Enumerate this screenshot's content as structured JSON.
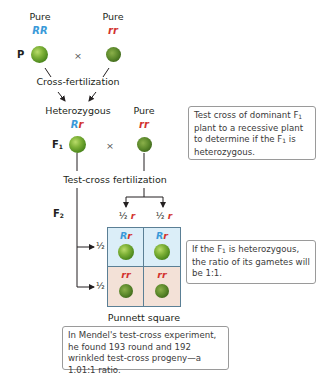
{
  "colors": {
    "dominant_allele": "#3a9ad9",
    "recessive_allele": "#d2322d",
    "punnett_top_fill": "#dbeef8",
    "punnett_bottom_fill": "#f3e1d7",
    "punnett_border": "#5a7f95",
    "note_border": "#9a9a9a"
  },
  "parental": {
    "generation_label": "P",
    "left": {
      "purity": "Pure",
      "genotype": {
        "dominant": "RR",
        "recessive": ""
      },
      "phenotype": "round"
    },
    "cross_symbol": "×",
    "right": {
      "purity": "Pure",
      "genotype": {
        "dominant": "",
        "recessive": "rr"
      },
      "phenotype": "wrinkled"
    },
    "process": "Cross-fertilization"
  },
  "f1": {
    "generation_label": "F",
    "generation_sub": "1",
    "left": {
      "purity": "Heterozygous",
      "genotype": {
        "dominant": "R",
        "recessive": "r"
      },
      "phenotype": "round"
    },
    "cross_symbol": "×",
    "right": {
      "purity": "Pure",
      "genotype": {
        "dominant": "",
        "recessive": "rr"
      },
      "phenotype": "wrinkled"
    },
    "process": "Test-cross fertilization"
  },
  "f2": {
    "generation_label": "F",
    "generation_sub": "2",
    "column_gametes": [
      {
        "fraction": "½",
        "allele": "r"
      },
      {
        "fraction": "½",
        "allele": "r"
      }
    ],
    "row_gametes": [
      {
        "fraction": "½",
        "allele": "R",
        "kind": "dominant"
      },
      {
        "fraction": "½",
        "allele": "r",
        "kind": "recessive"
      }
    ],
    "cells": [
      [
        {
          "dominant": "R",
          "recessive": "r",
          "phenotype": "round"
        },
        {
          "dominant": "R",
          "recessive": "r",
          "phenotype": "round"
        }
      ],
      [
        {
          "dominant": "",
          "recessive": "rr",
          "phenotype": "wrinkled"
        },
        {
          "dominant": "",
          "recessive": "rr",
          "phenotype": "wrinkled"
        }
      ]
    ],
    "caption": "Punnett square"
  },
  "notes": {
    "test_cross": {
      "part1": "Test cross of dominant F",
      "sub1": "1",
      "part2": " plant to a recessive plant to determine if the F",
      "sub2": "1",
      "part3": " is heterozygous."
    },
    "ratio": {
      "part1": "If the F",
      "sub1": "1",
      "part2": " is heterozygous, the ratio of its gametes will be 1:1."
    },
    "mendel": {
      "text": "In Mendel's test-cross experiment, he found 193 round and 192 wrinkled test-cross progeny—a 1.01:1 ratio."
    }
  }
}
